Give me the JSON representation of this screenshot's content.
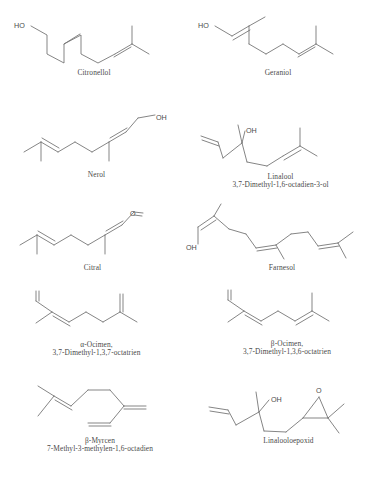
{
  "page": {
    "background": "#ffffff",
    "line_color": "#6f6f6f",
    "text_color": "#4a4a4a"
  },
  "molecules": [
    {
      "id": "citronellol",
      "name": "Citronellol",
      "subtitle": "",
      "labels": [
        "HO"
      ],
      "atom_labels": {
        "oh": "HO"
      }
    },
    {
      "id": "geraniol",
      "name": "Geraniol",
      "subtitle": "",
      "labels": [
        "HO"
      ],
      "atom_labels": {
        "oh": "HO"
      }
    },
    {
      "id": "nerol",
      "name": "Nerol",
      "subtitle": "",
      "labels": [
        "OH"
      ],
      "atom_labels": {
        "oh": "OH"
      }
    },
    {
      "id": "linalool",
      "name": "Linalool",
      "subtitle": "3,7-Dimethyl-1,6-octadien-3-ol",
      "labels": [
        "OH"
      ],
      "atom_labels": {
        "oh": "OH"
      }
    },
    {
      "id": "citral",
      "name": "Citral",
      "subtitle": "",
      "labels": [
        "O"
      ],
      "atom_labels": {
        "o": "O"
      }
    },
    {
      "id": "farnesol",
      "name": "Farnesol",
      "subtitle": "",
      "labels": [
        "OH"
      ],
      "atom_labels": {
        "oh": "OH"
      }
    },
    {
      "id": "alpha-ocimen",
      "name": "α-Ocimen,",
      "subtitle": "3,7-Dimethyl-1,3,7-octatrien",
      "labels": [],
      "atom_labels": {}
    },
    {
      "id": "beta-ocimen",
      "name": "β-Ocimen,",
      "subtitle": "3,7-Dimethyl-1,3,6-octatrien",
      "labels": [],
      "atom_labels": {}
    },
    {
      "id": "beta-myrcen",
      "name": "β-Myrcen",
      "subtitle": "7-Methyl-3-methylen-1,6-octadien",
      "labels": [],
      "atom_labels": {}
    },
    {
      "id": "linalooloepoxid",
      "name": "Linalooloepoxid",
      "subtitle": "",
      "labels": [
        "OH",
        "O"
      ],
      "atom_labels": {
        "oh": "OH",
        "o": "O"
      }
    }
  ]
}
